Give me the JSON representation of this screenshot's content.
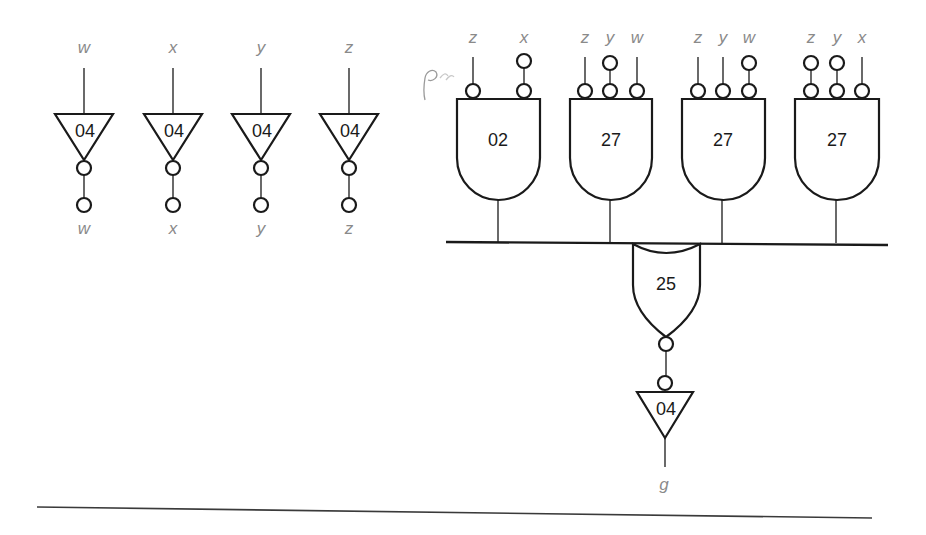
{
  "diagram": {
    "type": "logic-circuit",
    "inverters": [
      {
        "id": "inv-w",
        "chip": "04",
        "input_label": "w",
        "output_label": "w"
      },
      {
        "id": "inv-x",
        "chip": "04",
        "input_label": "x",
        "output_label": "x"
      },
      {
        "id": "inv-y",
        "chip": "04",
        "input_label": "y",
        "output_label": "y"
      },
      {
        "id": "inv-z",
        "chip": "04",
        "input_label": "z",
        "output_label": "z"
      }
    ],
    "and_gates": [
      {
        "id": "gate-02",
        "chip": "02",
        "inputs": [
          {
            "label": "z",
            "inverted_source": false
          },
          {
            "label": "x",
            "inverted_source": true
          }
        ]
      },
      {
        "id": "gate-27a",
        "chip": "27",
        "inputs": [
          {
            "label": "z",
            "inverted_source": false
          },
          {
            "label": "y",
            "inverted_source": true
          },
          {
            "label": "w",
            "inverted_source": false
          }
        ]
      },
      {
        "id": "gate-27b",
        "chip": "27",
        "inputs": [
          {
            "label": "z",
            "inverted_source": false
          },
          {
            "label": "y",
            "inverted_source": false
          },
          {
            "label": "w",
            "inverted_source": true
          }
        ]
      },
      {
        "id": "gate-27c",
        "chip": "27",
        "inputs": [
          {
            "label": "z",
            "inverted_source": true
          },
          {
            "label": "y",
            "inverted_source": true
          },
          {
            "label": "x",
            "inverted_source": false
          }
        ]
      }
    ],
    "or_gate": {
      "id": "gate-25",
      "chip": "25"
    },
    "output_inverter": {
      "id": "inv-out",
      "chip": "04",
      "output_label": "g"
    }
  }
}
